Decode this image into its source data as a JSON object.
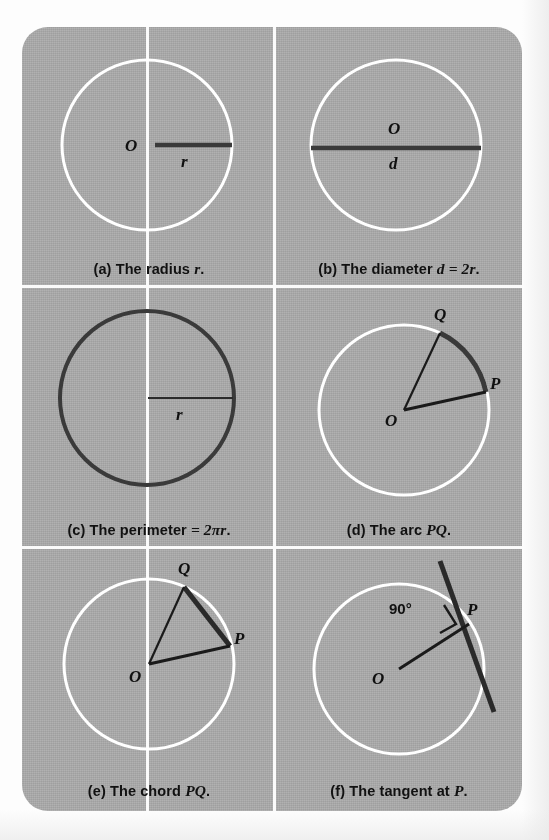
{
  "figure": {
    "background_color": "#a8a8a8",
    "divider_color": "#fafafa",
    "ink_color": "#1a1a1a",
    "highlight_color": "#ffffff",
    "panels": [
      {
        "id": "a",
        "caption_prefix": "(a)",
        "caption_text": "The radius",
        "caption_math": "r",
        "caption_suffix": ".",
        "caption_full": "(a) The radius r.",
        "labels": {
          "center": "O",
          "segment": "r"
        },
        "circle_style": "white-outline",
        "feature": "radius"
      },
      {
        "id": "b",
        "caption_prefix": "(b)",
        "caption_text": "The diameter",
        "caption_math": "d = 2r",
        "caption_suffix": ".",
        "caption_full": "(b) The diameter d = 2r.",
        "labels": {
          "center": "O",
          "segment": "d"
        },
        "circle_style": "white-outline",
        "feature": "diameter"
      },
      {
        "id": "c",
        "caption_prefix": "(c)",
        "caption_text": "The perimeter",
        "caption_math": "= 2πr",
        "caption_suffix": ".",
        "caption_full": "(c) The perimeter = 2πr.",
        "labels": {
          "segment": "r"
        },
        "circle_style": "dark-outline",
        "feature": "perimeter"
      },
      {
        "id": "d",
        "caption_prefix": "(d)",
        "caption_text": "The arc",
        "caption_math": "PQ",
        "caption_suffix": ".",
        "caption_full": "(d) The arc PQ.",
        "labels": {
          "center": "O",
          "point_p": "P",
          "point_q": "Q"
        },
        "circle_style": "white-outline",
        "feature": "arc"
      },
      {
        "id": "e",
        "caption_prefix": "(e)",
        "caption_text": "The chord",
        "caption_math": "PQ",
        "caption_suffix": ".",
        "caption_full": "(e) The chord PQ.",
        "labels": {
          "center": "O",
          "point_p": "P",
          "point_q": "Q"
        },
        "circle_style": "white-outline",
        "feature": "chord"
      },
      {
        "id": "f",
        "caption_prefix": "(f)",
        "caption_text": "The tangent at",
        "caption_math": "P",
        "caption_suffix": ".",
        "caption_full": "(f) The tangent at P.",
        "labels": {
          "center": "O",
          "point_p": "P",
          "angle": "90°"
        },
        "circle_style": "white-outline",
        "feature": "tangent"
      }
    ]
  }
}
